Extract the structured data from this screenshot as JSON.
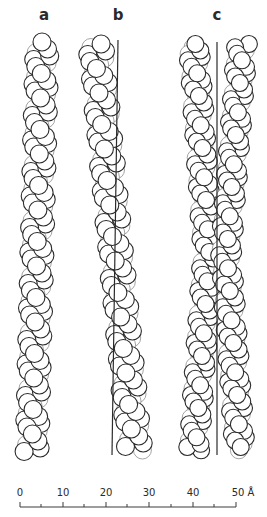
{
  "figure": {
    "panels": [
      {
        "label": "a",
        "label_x": 44,
        "reference_lines": [],
        "helices": [
          {
            "axis_top": [
              42,
              42
            ],
            "axis_bottom": [
              32,
              452
            ],
            "radius": 9,
            "amplitude": 8,
            "pitch": 56,
            "per_turn": 8,
            "phase": 0
          }
        ]
      },
      {
        "label": "b",
        "label_x": 118,
        "reference_lines": [
          {
            "x1": 118,
            "y1": 40,
            "x2": 112,
            "y2": 455
          }
        ],
        "helices": [
          {
            "axis_top": [
              96,
              44
            ],
            "axis_bottom": [
              135,
              450
            ],
            "radius": 9,
            "amplitude": 9,
            "pitch": 56,
            "per_turn": 8,
            "phase": 0.6
          }
        ]
      },
      {
        "label": "c",
        "label_x": 217,
        "reference_lines": [
          {
            "x1": 217,
            "y1": 42,
            "x2": 217,
            "y2": 455
          }
        ],
        "helices": [
          {
            "axis_top": [
              194,
              44
            ],
            "axis_mid": [
              208,
              250
            ],
            "axis_bottom": [
              194,
              450
            ],
            "radius": 8.5,
            "amplitude": 7,
            "pitch": 52,
            "per_turn": 8,
            "phase": 0.2
          },
          {
            "axis_top": [
              242,
              44
            ],
            "axis_mid": [
              226,
              250
            ],
            "axis_bottom": [
              240,
              450
            ],
            "radius": 8.5,
            "amplitude": 7,
            "pitch": 52,
            "per_turn": 8,
            "phase": 1.7
          }
        ]
      }
    ],
    "scale_bar": {
      "unit": "Å",
      "ticks": [
        {
          "value": 0,
          "x": 20,
          "label": "0"
        },
        {
          "value": 5,
          "x": 41,
          "label": ""
        },
        {
          "value": 10,
          "x": 63,
          "label": "10"
        },
        {
          "value": 15,
          "x": 84,
          "label": ""
        },
        {
          "value": 20,
          "x": 106,
          "label": "20"
        },
        {
          "value": 25,
          "x": 127,
          "label": ""
        },
        {
          "value": 30,
          "x": 149,
          "label": "30"
        },
        {
          "value": 35,
          "x": 171,
          "label": ""
        },
        {
          "value": 40,
          "x": 193,
          "label": "40"
        },
        {
          "value": 45,
          "x": 214,
          "label": ""
        },
        {
          "value": 50,
          "x": 236,
          "label": "50 Å"
        }
      ],
      "baseline_y": 507
    }
  }
}
